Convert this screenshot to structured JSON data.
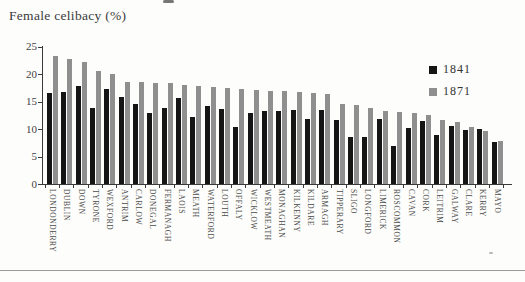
{
  "chart": {
    "title": "Female celibacy (%)"
  },
  "legend": {
    "items": [
      {
        "label": "1841",
        "color": "#151515"
      },
      {
        "label": "1871",
        "color": "#8f8f8f"
      }
    ]
  },
  "chart_data": {
    "type": "bar",
    "title": "Female celibacy (%)",
    "xlabel": "",
    "ylabel": "Female celibacy (%)",
    "ylim": [
      0,
      25
    ],
    "yticks": [
      0,
      5,
      10,
      15,
      20,
      25
    ],
    "grid": false,
    "legend_position": "top-right",
    "categories": [
      "LONDONDERRY",
      "DUBLIN",
      "DOWN",
      "TYRONE",
      "WEXFORD",
      "ANTRIM",
      "CARLOW",
      "DONEGAL",
      "FERMANAGH",
      "LAOIS",
      "MEATH",
      "WATERFORD",
      "LOUTH",
      "OFFALY",
      "WICKLOW",
      "WESTMEATH",
      "MONAGHAN",
      "KILKENNY",
      "KILDARE",
      "ARMAGH",
      "TIPPERARY",
      "SLIGO",
      "LONGFORD",
      "LIMERICK",
      "ROSCOMMON",
      "CAVAN",
      "CORK",
      "LEITRIM",
      "GALWAY",
      "CLARE",
      "KERRY",
      "MAYO"
    ],
    "series": [
      {
        "name": "1841",
        "color": "#151515",
        "values": [
          16.6,
          16.8,
          17.8,
          13.9,
          17.2,
          15.9,
          14.5,
          12.9,
          13.8,
          15.6,
          12.2,
          14.2,
          13.6,
          10.3,
          13.0,
          13.3,
          13.3,
          13.5,
          11.9,
          13.5,
          11.6,
          8.6,
          8.5,
          11.8,
          6.9,
          10.1,
          11.5,
          8.9,
          10.5,
          9.8,
          10.0,
          7.7
        ]
      },
      {
        "name": "1871",
        "color": "#8f8f8f",
        "values": [
          23.2,
          22.7,
          22.2,
          20.5,
          20.0,
          18.6,
          18.5,
          18.4,
          18.3,
          18.0,
          17.8,
          17.6,
          17.5,
          17.3,
          17.1,
          17.0,
          16.9,
          16.8,
          16.6,
          16.4,
          14.6,
          14.4,
          13.8,
          13.3,
          13.1,
          13.0,
          12.5,
          11.6,
          11.2,
          10.4,
          9.6,
          7.9
        ]
      }
    ]
  }
}
